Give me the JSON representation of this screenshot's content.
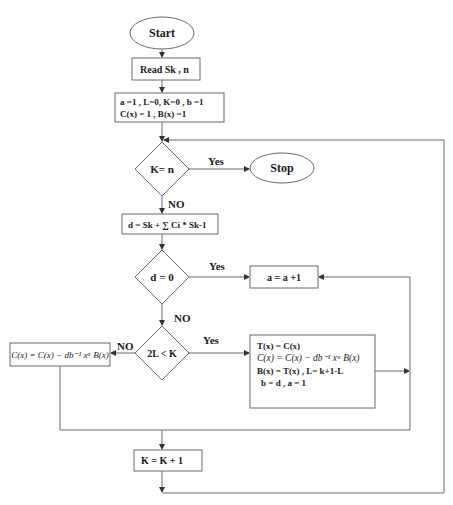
{
  "diagram": {
    "type": "flowchart",
    "title": "",
    "nodes": {
      "start": {
        "label": "Start",
        "shape": "terminator"
      },
      "read": {
        "label": "Read Sk , n",
        "shape": "process"
      },
      "init": {
        "line1": "a =1 , L=0, K=0 , b =1",
        "line2": "C(x) = 1 , B(x) =1",
        "shape": "process"
      },
      "check_k": {
        "label": "K= n",
        "shape": "decision"
      },
      "stop": {
        "label": "Stop",
        "shape": "terminator"
      },
      "discrepancy": {
        "label": "d = Sk + ∑ Ci * Sk-1",
        "shape": "process"
      },
      "check_d": {
        "label": "d = 0",
        "shape": "decision"
      },
      "inc_a": {
        "label": "a = a +1",
        "shape": "process"
      },
      "check_l": {
        "label": "2L < K",
        "shape": "decision"
      },
      "update_c": {
        "label": "C(x) = C(x) − db⁻¹ xᵃ B(x)",
        "shape": "process"
      },
      "update_all": {
        "line1": "T(x) = C(x)",
        "line2": "C(x) = C(x) − db⁻¹ xᵃ B(x)",
        "line3": "B(x) = T(x) ,  L= k+1-L",
        "line4": "b  = d   , a = 1",
        "shape": "process"
      },
      "inc_k": {
        "label": "K = K + 1",
        "shape": "process"
      }
    },
    "edges": {
      "k_yes": "Yes",
      "k_no": "NO",
      "d_yes": "Yes",
      "d_no": "NO",
      "l_yes": "Yes",
      "l_no": "NO"
    },
    "colors": {
      "stroke": "#6b6b6b",
      "text": "#1a1a1a",
      "background": "#ffffff"
    }
  }
}
